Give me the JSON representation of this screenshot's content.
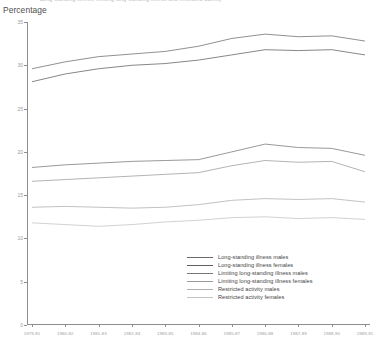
{
  "chart_title": "Long-standing illness, limiting long-standing illness and restricted activity",
  "axis": {
    "ylabel": "Percentage",
    "xlabel": ""
  },
  "chart_data": {
    "type": "line",
    "title": "Long-standing illness, limiting long-standing illness and restricted activity",
    "xlabel": "",
    "ylabel": "Percentage",
    "ylim": [
      0,
      35
    ],
    "yticks": [
      0,
      5,
      10,
      15,
      20,
      25,
      30,
      35
    ],
    "ytick_labels": [
      "0",
      "5",
      "10",
      "15",
      "20",
      "25",
      "30",
      "35"
    ],
    "grid": false,
    "legend_position": "bottom-right",
    "categories": [
      "1979-81",
      "1980-82",
      "1981-83",
      "1982-84",
      "1983-85",
      "1984-86",
      "1985-87",
      "1986-88",
      "1987-89",
      "1988-90",
      "1989-91"
    ],
    "series": [
      {
        "name": "Long-standing illness males",
        "color": "#6b6b6b",
        "values": [
          29.6,
          30.4,
          31.0,
          31.3,
          31.6,
          32.2,
          33.1,
          33.6,
          33.3,
          33.4,
          32.8
        ]
      },
      {
        "name": "Long-standing illness females",
        "color": "#5f5f5f",
        "values": [
          28.1,
          29.0,
          29.6,
          30.0,
          30.2,
          30.6,
          31.2,
          31.8,
          31.7,
          31.8,
          31.2
        ]
      },
      {
        "name": "Limiting long-standing illness males",
        "color": "#777777",
        "values": [
          18.2,
          18.5,
          18.7,
          18.9,
          19.0,
          19.1,
          20.0,
          20.9,
          20.5,
          20.4,
          19.6
        ]
      },
      {
        "name": "Limiting long-standing illness females",
        "color": "#9a9a9a",
        "values": [
          16.6,
          16.8,
          17.0,
          17.2,
          17.4,
          17.6,
          18.4,
          19.0,
          18.8,
          18.9,
          17.7
        ]
      },
      {
        "name": "Restricted activity males",
        "color": "#adadad",
        "values": [
          13.6,
          13.7,
          13.6,
          13.5,
          13.6,
          13.9,
          14.4,
          14.6,
          14.5,
          14.6,
          14.2
        ]
      },
      {
        "name": "Restricted activity females",
        "color": "#c2c2c2",
        "values": [
          11.8,
          11.6,
          11.4,
          11.6,
          11.9,
          12.1,
          12.4,
          12.5,
          12.3,
          12.4,
          12.2
        ]
      }
    ]
  },
  "legend": {
    "items": [
      {
        "label": "Long-standing illness males",
        "color": "#6b6b6b"
      },
      {
        "label": "Long-standing illness females",
        "color": "#5f5f5f"
      },
      {
        "label": "Limiting long-standing illness males",
        "color": "#777777"
      },
      {
        "label": "Limiting long-standing illness females",
        "color": "#9a9a9a"
      },
      {
        "label": "Restricted activity males",
        "color": "#adadad"
      },
      {
        "label": "Restricted activity females",
        "color": "#c2c2c2"
      }
    ]
  }
}
